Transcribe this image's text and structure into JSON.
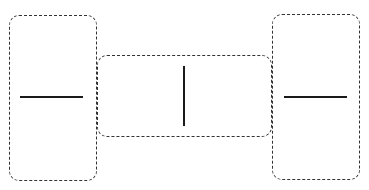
{
  "diagram": {
    "stroke_color": "#333333",
    "line_color": "#1a1a1a",
    "boxes": [
      {
        "id": "left",
        "orientation": "tall",
        "glyph": "horizontal-line"
      },
      {
        "id": "middle",
        "orientation": "wide",
        "glyph": "vertical-line"
      },
      {
        "id": "right",
        "orientation": "tall",
        "glyph": "horizontal-line"
      }
    ]
  }
}
